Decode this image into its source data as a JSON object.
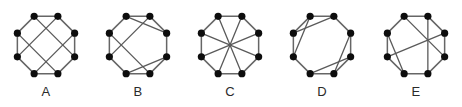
{
  "figure": {
    "title": "",
    "background_color": "#ffffff",
    "node_color": "#0d0d0d",
    "edge_color": "#5a5a5a",
    "outline_color": "#666666",
    "label_color": "#2a2a2a",
    "panel_count": 5
  },
  "chart_data": {
    "type": "diagram",
    "subtype": "graph-isomorphism-figure",
    "title": "",
    "xlabel": "",
    "ylabel": "",
    "node_count_per_graph": 8,
    "node_radius": 3.6,
    "octagon": {
      "center_x": 46,
      "center_y": 39,
      "radius": 31,
      "start_angle_deg": -67.5,
      "vertex_indices": [
        0,
        1,
        2,
        3,
        4,
        5,
        6,
        7
      ],
      "vertex_names": [
        "top-left",
        "top-right",
        "right-upper",
        "right-lower",
        "bottom-right",
        "bottom-left",
        "left-lower",
        "left-upper"
      ]
    },
    "graphs": [
      {
        "label": "A",
        "panel_x": 0,
        "cycle_edges": [
          [
            0,
            1
          ],
          [
            1,
            2
          ],
          [
            2,
            3
          ],
          [
            3,
            4
          ],
          [
            4,
            5
          ],
          [
            5,
            6
          ],
          [
            6,
            7
          ],
          [
            7,
            0
          ]
        ],
        "chords": [
          [
            0,
            5
          ],
          [
            1,
            4
          ],
          [
            7,
            2
          ],
          [
            6,
            3
          ]
        ],
        "chord_count": 4,
        "edge_count": 12,
        "degree_sequence": [
          3,
          3,
          3,
          3,
          3,
          3,
          3,
          3
        ],
        "pattern": "grid of two vertical and two horizontal chords"
      },
      {
        "label": "B",
        "panel_x": 92,
        "cycle_edges": [
          [
            0,
            1
          ],
          [
            1,
            2
          ],
          [
            2,
            3
          ],
          [
            3,
            4
          ],
          [
            4,
            5
          ],
          [
            5,
            6
          ],
          [
            6,
            7
          ],
          [
            7,
            0
          ]
        ],
        "chords": [
          [
            7,
            1
          ],
          [
            0,
            5
          ],
          [
            6,
            3
          ],
          [
            2,
            4
          ]
        ],
        "chord_count": 4,
        "edge_count": 12,
        "degree_sequence": [
          3,
          3,
          3,
          3,
          3,
          3,
          3,
          3
        ],
        "pattern": "two short corner chords plus one vertical and one horizontal chord"
      },
      {
        "label": "C",
        "panel_x": 184,
        "cycle_edges": [
          [
            0,
            1
          ],
          [
            1,
            2
          ],
          [
            2,
            3
          ],
          [
            3,
            4
          ],
          [
            4,
            5
          ],
          [
            5,
            6
          ],
          [
            6,
            7
          ],
          [
            7,
            0
          ]
        ],
        "chords": [
          [
            0,
            4
          ],
          [
            1,
            5
          ],
          [
            2,
            6
          ],
          [
            3,
            7
          ]
        ],
        "chord_count": 4,
        "edge_count": 12,
        "degree_sequence": [
          3,
          3,
          3,
          3,
          3,
          3,
          3,
          3
        ],
        "pattern": "all four main diagonals meeting at the center (star)"
      },
      {
        "label": "D",
        "panel_x": 276,
        "cycle_edges": [
          [
            0,
            1
          ],
          [
            1,
            2
          ],
          [
            2,
            3
          ],
          [
            3,
            4
          ],
          [
            4,
            5
          ],
          [
            5,
            6
          ],
          [
            6,
            7
          ],
          [
            7,
            0
          ]
        ],
        "chords": [
          [
            1,
            3
          ],
          [
            2,
            4
          ],
          [
            5,
            7
          ],
          [
            6,
            0
          ]
        ],
        "chord_count": 4,
        "edge_count": 12,
        "degree_sequence": [
          3,
          3,
          3,
          3,
          3,
          3,
          3,
          3
        ],
        "pattern": "two short chord pairs forming triangles at upper-right and lower-left"
      },
      {
        "label": "E",
        "panel_x": 370,
        "cycle_edges": [
          [
            0,
            1
          ],
          [
            1,
            2
          ],
          [
            2,
            3
          ],
          [
            3,
            4
          ],
          [
            4,
            5
          ],
          [
            5,
            6
          ],
          [
            6,
            7
          ],
          [
            7,
            0
          ]
        ],
        "chords": [
          [
            0,
            3
          ],
          [
            1,
            5
          ],
          [
            7,
            2
          ],
          [
            6,
            4
          ]
        ],
        "chord_count": 4,
        "edge_count": 12,
        "degree_sequence": [
          3,
          3,
          3,
          3,
          3,
          3,
          3,
          3
        ],
        "pattern": "two long crossing chords plus a horizontal and a lower chord"
      }
    ]
  }
}
